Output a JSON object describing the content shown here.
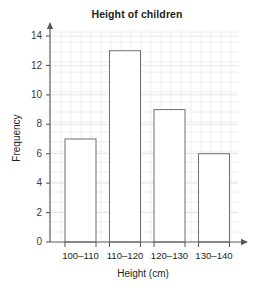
{
  "chart_data": {
    "type": "bar",
    "title": "Height of children",
    "xlabel": "Height (cm)",
    "ylabel": "Frequency",
    "categories": [
      "100–110",
      "110–120",
      "120–130",
      "130–140"
    ],
    "values": [
      7,
      13,
      9,
      6
    ],
    "ylim": [
      0,
      14
    ],
    "ytick_labels": [
      "0",
      "2",
      "4",
      "6",
      "8",
      "10",
      "12",
      "14"
    ],
    "ytick_values": [
      0,
      2,
      4,
      6,
      8,
      10,
      12,
      14
    ],
    "grid": true,
    "legend": null,
    "bar_fill": "#ffffff",
    "bar_stroke": "#6f6f6f",
    "axis_color": "#58595b",
    "grid_color": "#eceef0",
    "background": "#ffffff"
  }
}
